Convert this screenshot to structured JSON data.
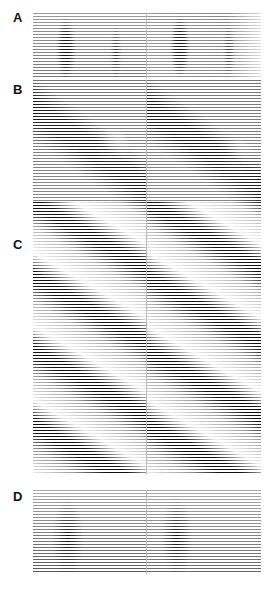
{
  "figure": {
    "panels": [
      {
        "id": "A",
        "label": "A"
      },
      {
        "id": "B",
        "label": "B"
      },
      {
        "id": "C",
        "label": "C"
      },
      {
        "id": "D",
        "label": "D"
      }
    ]
  },
  "colors": {
    "ink": "#111111",
    "background": "#ffffff"
  }
}
